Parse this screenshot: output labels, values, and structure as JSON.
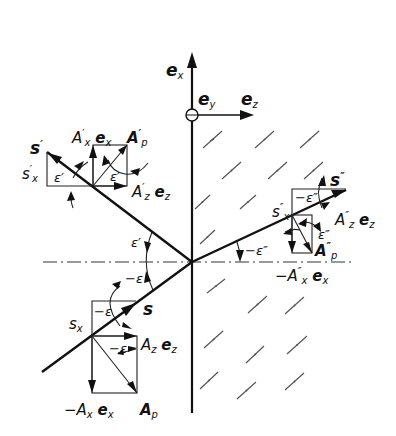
{
  "figure": {
    "colors": {
      "ink": "#111111",
      "background": "#ffffff",
      "hatch": "#555555"
    }
  },
  "axes": {
    "vertical": {
      "label": "e",
      "sub": "x"
    },
    "out_of_plane": {
      "label": "e",
      "sub": "y"
    },
    "horizontal": {
      "label": "e",
      "sub": "z"
    }
  },
  "incident": {
    "ray": {
      "label": "s"
    },
    "sx": {
      "label": "s",
      "sub": "x"
    },
    "angle_box": {
      "label": "−ε"
    },
    "angle_normal": {
      "label": "−ε"
    },
    "angle_vector": {
      "label": "−ε"
    },
    "az": {
      "label": "A",
      "sub": "z",
      "unit": "e",
      "unit_sub": "z"
    },
    "ax": {
      "prefix": "−A",
      "sub": "x",
      "unit": "e",
      "unit_sub": "x"
    },
    "ap": {
      "label": "A",
      "sub": "p"
    }
  },
  "reflected": {
    "ray": {
      "label": "s",
      "sup": "′"
    },
    "sx": {
      "label": "s",
      "sup": "′",
      "sub": "x"
    },
    "angle_box": {
      "label": "ε′"
    },
    "angle_vector": {
      "label": "ε′"
    },
    "angle_normal": {
      "label": "ε′"
    },
    "ax": {
      "label": "A",
      "sup": "′",
      "sub": "x",
      "unit": "e",
      "unit_sub": "x"
    },
    "az": {
      "label": "A",
      "sup": "′",
      "sub": "z",
      "unit": "e",
      "unit_sub": "z"
    },
    "ap": {
      "label": "A",
      "sup": "′",
      "sub": "p"
    }
  },
  "refracted": {
    "ray": {
      "label": "s",
      "sup": "″"
    },
    "sx": {
      "label": "s",
      "sup": "″",
      "sub": "x"
    },
    "angle_box": {
      "label": "−ε″"
    },
    "angle_vector": {
      "label": "ε″"
    },
    "angle_normal": {
      "label": "−ε″"
    },
    "az": {
      "label": "A",
      "sup": "″",
      "sub": "z",
      "unit": "e",
      "unit_sub": "z"
    },
    "ax": {
      "prefix": "−A",
      "sup": "″",
      "sub": "x",
      "unit": "e",
      "unit_sub": "x"
    },
    "ap": {
      "label": "A",
      "sup": "″",
      "sub": "p"
    }
  }
}
